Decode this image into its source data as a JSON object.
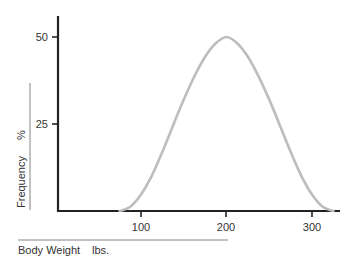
{
  "chart_data": {
    "type": "line",
    "title": "",
    "xlabel": "Body Weight",
    "xunit": "lbs.",
    "ylabel": "Frequency",
    "yunit": "%",
    "x_ticks": [
      100,
      200,
      300
    ],
    "y_ticks": [
      25,
      50
    ],
    "xlim": [
      0,
      330
    ],
    "ylim": [
      0,
      55
    ],
    "grid": false,
    "legend": null,
    "series": [
      {
        "name": "Body weight distribution",
        "color": "#bdbdbd",
        "x": [
          75,
          87.5,
          100,
          112.5,
          125,
          137.5,
          150,
          162.5,
          175,
          187.5,
          200,
          212.5,
          225,
          237.5,
          250,
          262.5,
          275,
          287.5,
          300,
          312.5,
          325
        ],
        "y": [
          0,
          1.2,
          4.7,
          10.1,
          17,
          24.6,
          32,
          38.7,
          44.3,
          48.2,
          50,
          48.2,
          44.3,
          38.7,
          32,
          24.6,
          17,
          10.1,
          4.7,
          1.2,
          0
        ]
      }
    ]
  },
  "labels": {
    "x_title": "Body Weight",
    "x_unit": "lbs.",
    "y_title": "Frequency",
    "y_unit": "%",
    "tick_x_100": "100",
    "tick_x_200": "200",
    "tick_x_300": "300",
    "tick_y_25": "25",
    "tick_y_50": "50"
  }
}
